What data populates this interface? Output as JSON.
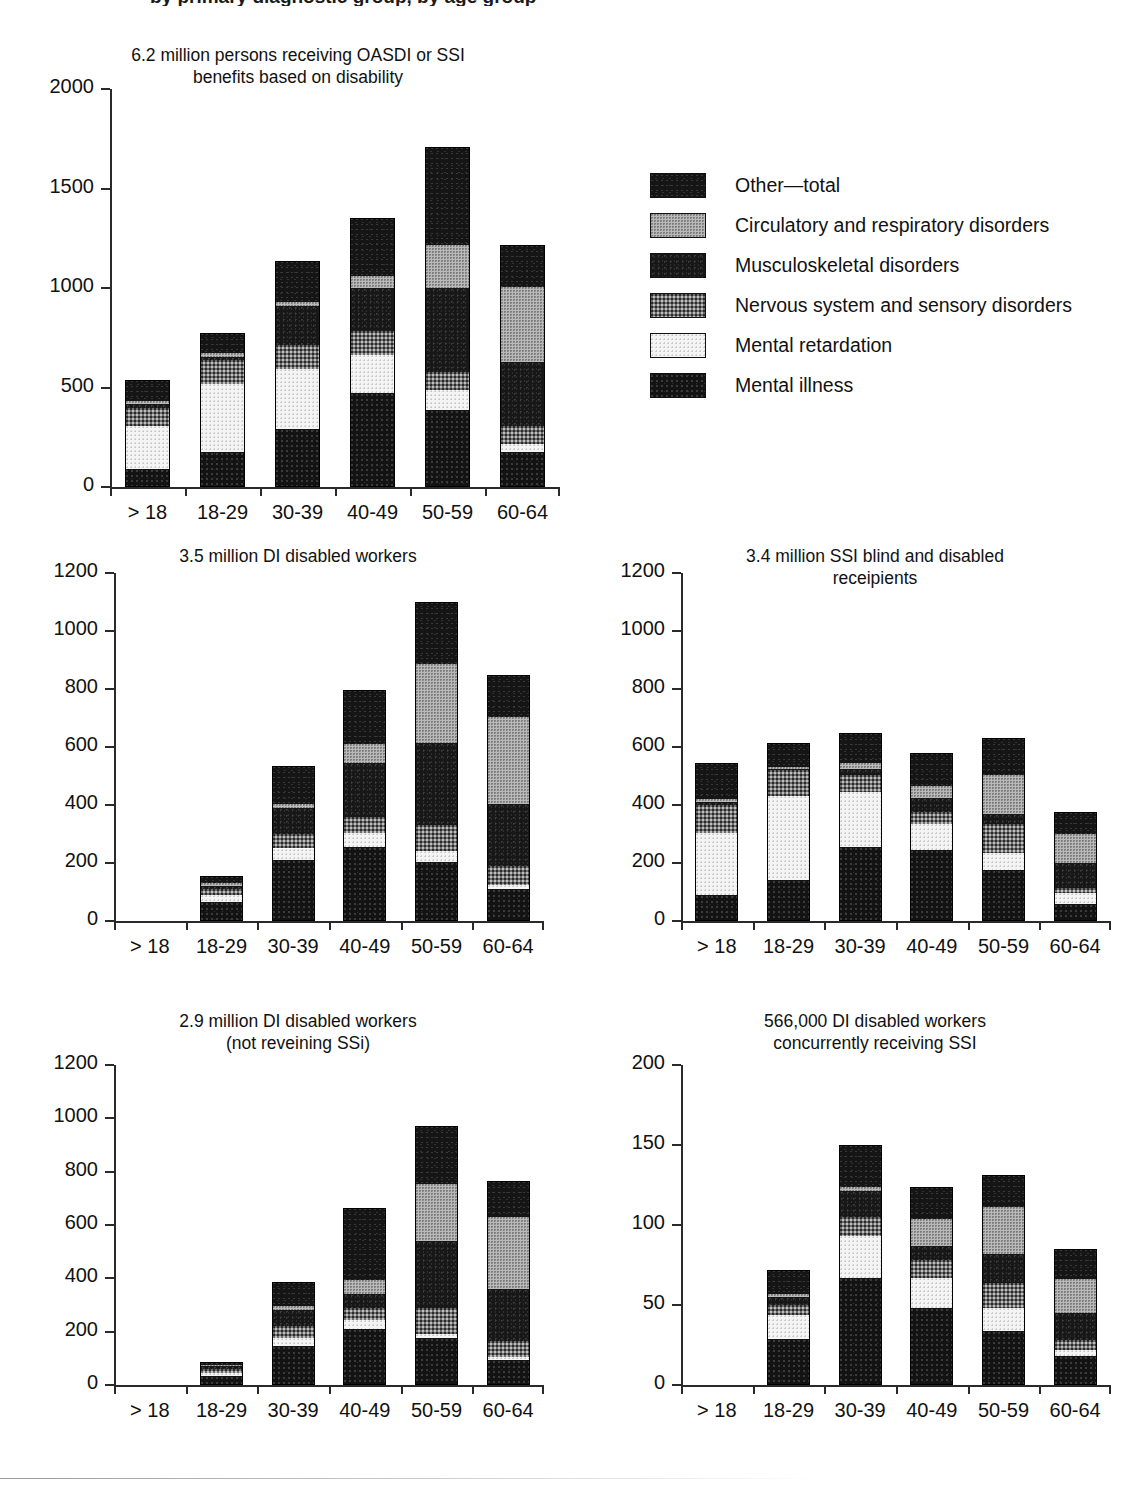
{
  "figure": {
    "clipped_heading": "by primary diagnostic group, by age group",
    "x_categories": [
      "> 18",
      "18-29",
      "30-39",
      "40-49",
      "50-59",
      "60-64"
    ],
    "legend_title": "",
    "groups": [
      {
        "key": "other",
        "label": "Other—total",
        "fill": "f-other",
        "color": "#151515"
      },
      {
        "key": "circ",
        "label": "Circulatory and respiratory disorders",
        "fill": "f-circ",
        "color": "#b9b9b9"
      },
      {
        "key": "musc",
        "label": "Musculoskeletal disorders",
        "fill": "f-musc",
        "color": "#171717"
      },
      {
        "key": "nerv",
        "label": "Nervous system and sensory disorders",
        "fill": "f-nerv",
        "color": "#6e6e6e"
      },
      {
        "key": "retd",
        "label": "Mental retardation",
        "fill": "f-retd",
        "color": "#f4f4f4"
      },
      {
        "key": "illn",
        "label": "Mental illness",
        "fill": "f-illn",
        "color": "#131313"
      }
    ]
  },
  "chart_data": [
    {
      "id": "panel1",
      "type": "bar",
      "stacked": true,
      "title": "6.2 million persons receiving OASDI or SSI\nbenefits based on disability",
      "xlabel": "",
      "ylabel": "",
      "ylim": [
        0,
        2000
      ],
      "yticks": [
        0,
        500,
        1000,
        1500,
        2000
      ],
      "ytick_labels": [
        "0",
        "500",
        "1000",
        "1500",
        "2000"
      ],
      "grid": false,
      "categories": [
        "> 18",
        "18-29",
        "30-39",
        "40-49",
        "50-59",
        "60-64"
      ],
      "series": [
        {
          "name": "Mental illness",
          "values": [
            90,
            175,
            290,
            470,
            385,
            175
          ]
        },
        {
          "name": "Mental retardation",
          "values": [
            215,
            345,
            305,
            195,
            100,
            40
          ]
        },
        {
          "name": "Nervous system and sensory disorders",
          "values": [
            90,
            120,
            120,
            120,
            95,
            90
          ]
        },
        {
          "name": "Musculoskeletal disorders",
          "values": [
            20,
            15,
            195,
            215,
            420,
            325
          ]
        },
        {
          "name": "Circulatory and respiratory disorders",
          "values": [
            15,
            20,
            20,
            60,
            215,
            375
          ]
        },
        {
          "name": "Other—total",
          "values": [
            110,
            100,
            205,
            290,
            495,
            210
          ]
        }
      ],
      "totals": [
        540,
        775,
        1135,
        1350,
        1710,
        1215
      ]
    },
    {
      "id": "panel2",
      "type": "bar",
      "stacked": true,
      "title": "3.5 million DI disabled workers",
      "xlabel": "",
      "ylabel": "",
      "ylim": [
        0,
        1200
      ],
      "yticks": [
        0,
        200,
        400,
        600,
        800,
        1000,
        1200
      ],
      "ytick_labels": [
        "0",
        "200",
        "400",
        "600",
        "800",
        "1000",
        "1200"
      ],
      "grid": false,
      "categories": [
        "> 18",
        "18-29",
        "30-39",
        "40-49",
        "50-59",
        "60-64"
      ],
      "series": [
        {
          "name": "Mental illness",
          "values": [
            0,
            65,
            210,
            255,
            205,
            110
          ]
        },
        {
          "name": "Mental retardation",
          "values": [
            0,
            25,
            40,
            50,
            35,
            15
          ]
        },
        {
          "name": "Nervous system and sensory disorders",
          "values": [
            0,
            20,
            50,
            55,
            90,
            65
          ]
        },
        {
          "name": "Musculoskeletal disorders",
          "values": [
            0,
            10,
            90,
            185,
            285,
            215
          ]
        },
        {
          "name": "Circulatory and respiratory disorders",
          "values": [
            0,
            10,
            15,
            65,
            270,
            300
          ]
        },
        {
          "name": "Other—total",
          "values": [
            0,
            25,
            130,
            185,
            215,
            145
          ]
        }
      ],
      "totals": [
        0,
        155,
        535,
        795,
        1100,
        850
      ]
    },
    {
      "id": "panel3",
      "type": "bar",
      "stacked": true,
      "title": "3.4 million SSI blind and disabled\nreceipients",
      "xlabel": "",
      "ylabel": "",
      "ylim": [
        0,
        1200
      ],
      "yticks": [
        0,
        200,
        400,
        600,
        800,
        1000,
        1200
      ],
      "ytick_labels": [
        "0",
        "200",
        "400",
        "600",
        "800",
        "1000",
        "1200"
      ],
      "grid": false,
      "categories": [
        "> 18",
        "18-29",
        "30-39",
        "40-49",
        "50-59",
        "60-64"
      ],
      "series": [
        {
          "name": "Mental illness",
          "values": [
            90,
            140,
            255,
            245,
            175,
            60
          ]
        },
        {
          "name": "Mental retardation",
          "values": [
            215,
            290,
            190,
            90,
            60,
            35
          ]
        },
        {
          "name": "Nervous system and sensory disorders",
          "values": [
            95,
            90,
            60,
            40,
            100,
            20
          ]
        },
        {
          "name": "Musculoskeletal disorders",
          "values": [
            10,
            5,
            20,
            50,
            35,
            85
          ]
        },
        {
          "name": "Circulatory and respiratory disorders",
          "values": [
            10,
            5,
            20,
            40,
            135,
            100
          ]
        },
        {
          "name": "Other—total",
          "values": [
            125,
            85,
            105,
            115,
            125,
            75
          ]
        }
      ],
      "totals": [
        545,
        615,
        650,
        580,
        630,
        375
      ]
    },
    {
      "id": "panel4",
      "type": "bar",
      "stacked": true,
      "title": "2.9 million DI disabled workers\n(not reveining SSi)",
      "xlabel": "",
      "ylabel": "",
      "ylim": [
        0,
        1200
      ],
      "yticks": [
        0,
        200,
        400,
        600,
        800,
        1000,
        1200
      ],
      "ytick_labels": [
        "0",
        "200",
        "400",
        "600",
        "800",
        "1000",
        "1200"
      ],
      "grid": false,
      "categories": [
        "> 18",
        "18-29",
        "30-39",
        "40-49",
        "50-59",
        "60-64"
      ],
      "series": [
        {
          "name": "Mental illness",
          "values": [
            0,
            35,
            145,
            210,
            175,
            95
          ]
        },
        {
          "name": "Mental retardation",
          "values": [
            0,
            10,
            30,
            35,
            15,
            10
          ]
        },
        {
          "name": "Nervous system and sensory disorders",
          "values": [
            0,
            15,
            45,
            45,
            100,
            60
          ]
        },
        {
          "name": "Musculoskeletal disorders",
          "values": [
            0,
            10,
            60,
            50,
            250,
            195
          ]
        },
        {
          "name": "Circulatory and respiratory disorders",
          "values": [
            0,
            5,
            15,
            55,
            215,
            270
          ]
        },
        {
          "name": "Other—total",
          "values": [
            0,
            10,
            90,
            270,
            215,
            135
          ]
        }
      ],
      "totals": [
        0,
        85,
        385,
        665,
        970,
        765
      ]
    },
    {
      "id": "panel5",
      "type": "bar",
      "stacked": true,
      "title": "566,000 DI disabled workers\nconcurrently receiving SSI",
      "xlabel": "",
      "ylabel": "",
      "ylim": [
        0,
        200
      ],
      "yticks": [
        0,
        50,
        100,
        150,
        200
      ],
      "ytick_labels": [
        "0",
        "50",
        "100",
        "150",
        "200"
      ],
      "grid": false,
      "categories": [
        "> 18",
        "18-29",
        "30-39",
        "40-49",
        "50-59",
        "60-64"
      ],
      "series": [
        {
          "name": "Mental illness",
          "values": [
            0,
            29,
            67,
            48,
            34,
            18
          ]
        },
        {
          "name": "Mental retardation",
          "values": [
            0,
            15,
            26,
            19,
            14,
            4
          ]
        },
        {
          "name": "Nervous system and sensory disorders",
          "values": [
            0,
            6,
            12,
            11,
            16,
            6
          ]
        },
        {
          "name": "Musculoskeletal disorders",
          "values": [
            0,
            5,
            16,
            9,
            18,
            17
          ]
        },
        {
          "name": "Circulatory and respiratory disorders",
          "values": [
            0,
            2,
            3,
            17,
            29,
            21
          ]
        },
        {
          "name": "Other—total",
          "values": [
            0,
            15,
            26,
            20,
            20,
            19
          ]
        }
      ],
      "totals": [
        0,
        72,
        150,
        124,
        131,
        85
      ]
    }
  ]
}
